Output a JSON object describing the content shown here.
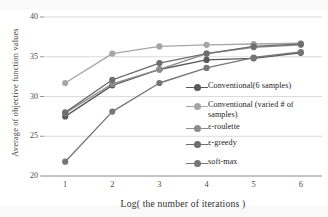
{
  "chart_data": {
    "type": "line",
    "title": "",
    "xlabel": "Log( the number of iterations )",
    "ylabel": "Average of objective function values",
    "x": [
      1,
      2,
      3,
      4,
      5,
      6
    ],
    "xtick_labels": [
      "1",
      "2",
      "3",
      "4",
      "5",
      "6"
    ],
    "ytick_labels": [
      "20",
      "25",
      "30",
      "35",
      "40"
    ],
    "ytick_values": [
      20,
      25,
      30,
      35,
      40
    ],
    "xlim": [
      0.55,
      6.45
    ],
    "ylim": [
      20,
      40
    ],
    "grid": "horizontal",
    "legend_position": "inside-right",
    "marker": "circle",
    "series": [
      {
        "name": "Conventional(6 samples)",
        "color": "#595959",
        "values": [
          27.5,
          31.4,
          33.4,
          34.6,
          34.8,
          35.5
        ]
      },
      {
        "name": "Conventional (varied # of\nsamples)",
        "color": "#a6a6a6",
        "values": [
          31.7,
          35.4,
          36.3,
          36.5,
          36.6,
          36.7
        ]
      },
      {
        "name": "ε-roulette",
        "color": "#8c8c8c",
        "values": [
          27.9,
          31.6,
          33.4,
          35.4,
          36.2,
          36.5
        ]
      },
      {
        "name": "ε-greedy",
        "color": "#6e6e6e",
        "values": [
          28.0,
          32.1,
          34.2,
          35.4,
          36.3,
          36.6
        ]
      },
      {
        "name": "soft-max",
        "color": "#767676",
        "values": [
          21.8,
          28.1,
          31.7,
          33.6,
          34.9,
          35.6
        ]
      }
    ]
  },
  "legend": {
    "items": [
      {
        "label": "Conventional(6 samples)"
      },
      {
        "label": "Conventional (varied # of\nsamples)"
      },
      {
        "label": "ε-roulette"
      },
      {
        "label": "ε-greedy"
      },
      {
        "label": "soft-max"
      }
    ]
  }
}
